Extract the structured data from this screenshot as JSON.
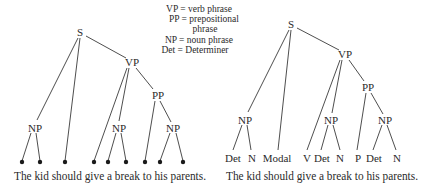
{
  "legend": {
    "items": [
      {
        "abbr": "VP",
        "line": "VP = verb phrase"
      },
      {
        "abbr": "PP",
        "line": "PP = prepositional"
      },
      {
        "abbr": "PP-cont",
        "line": "phrase"
      },
      {
        "abbr": "NP",
        "line": "NP = noun phrase"
      },
      {
        "abbr": "Det",
        "line": "Det = Determiner"
      }
    ]
  },
  "left_tree": {
    "nodes": {
      "s": "S",
      "vp": "VP",
      "pp": "PP",
      "np_subject": "NP",
      "np_object": "NP",
      "np_prep_object": "NP"
    },
    "leaf_markers": "dots",
    "sentence": "The kid should give a break to his parents."
  },
  "right_tree": {
    "nodes": {
      "s": "S",
      "vp": "VP",
      "pp": "PP",
      "np_subject": "NP",
      "np_object": "NP",
      "np_prep_object": "NP"
    },
    "leaves": [
      "Det",
      "N",
      "Modal",
      "V",
      "Det",
      "N",
      "P",
      "Det",
      "N"
    ],
    "sentence": "The kid should give a break to his parents."
  }
}
